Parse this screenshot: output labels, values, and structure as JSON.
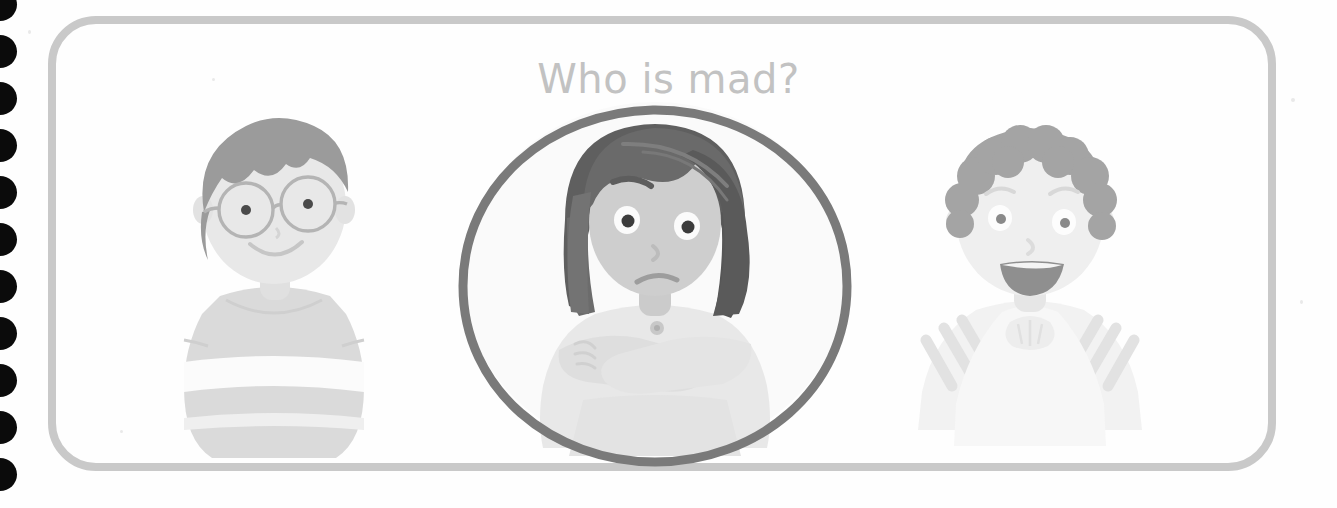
{
  "page": {
    "type": "worksheet-page",
    "background_color": "#fefefe",
    "width": 1337,
    "height": 508,
    "binding": {
      "name": "spiral-binding-holes",
      "hole_count": 11,
      "hole_color": "#0b0b0b",
      "spacing_px": 47
    }
  },
  "frame": {
    "name": "worksheet-frame",
    "border_color": "#c9c9c9",
    "border_width_px": 8,
    "corner_radius_px": 48
  },
  "title": {
    "text": "Who is mad?",
    "color": "#c2c2c2"
  },
  "answer": {
    "circle_color": "#7a7a7a",
    "circle_stroke_px": 8,
    "selected_character": "girl-arms-crossed",
    "selected_position": "center"
  },
  "characters": [
    {
      "id": "boy-glasses",
      "position": "left",
      "label": "Boy with glasses",
      "emotion": "happy",
      "hair_color": "#9a9a9a",
      "hair_style": "short-spiky",
      "skin_color": "#e3e3e3",
      "shirt_color": "#d6d6d6",
      "shirt_pattern": "horizontal-stripes",
      "wears_glasses": true,
      "mouth": "smile",
      "circled": false
    },
    {
      "id": "girl-arms-crossed",
      "position": "center",
      "label": "Girl with bob haircut",
      "emotion": "mad",
      "hair_color": "#6f6f6f",
      "hair_style": "bob",
      "skin_color": "#cdcdcd",
      "shirt_color": "#e6e6e6",
      "shirt_pattern": "plain",
      "wears_glasses": false,
      "mouth": "frown",
      "eyebrows": "angry",
      "arms": "crossed",
      "has_collar_button": true,
      "circled": true
    },
    {
      "id": "boy-curly-hair",
      "position": "right",
      "label": "Boy with curly hair",
      "emotion": "laughing",
      "hair_color": "#a8a8a8",
      "hair_style": "curly",
      "skin_color": "#ededed",
      "shirt_color": "#f0f0f0",
      "shirt_pattern": "diagonal-stripes",
      "wears_glasses": false,
      "mouth": "open-smile",
      "circled": false
    }
  ]
}
